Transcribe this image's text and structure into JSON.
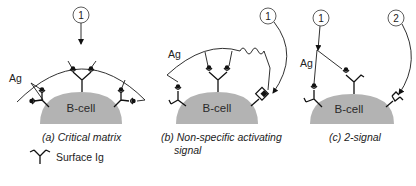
{
  "panels": [
    {
      "id": "a",
      "caption": "(a) Critical matrix",
      "cell_label": "B-cell",
      "antigen_label": "Ag",
      "signals": [
        {
          "number": "1"
        }
      ]
    },
    {
      "id": "b",
      "caption_line1": "(b) Non-specific activating",
      "caption_line2": "signal",
      "cell_label": "B-cell",
      "antigen_label": "Ag",
      "signals": [
        {
          "number": "1"
        }
      ]
    },
    {
      "id": "c",
      "caption": "(c) 2-signal",
      "cell_label": "B-cell",
      "antigen_label": "Ag",
      "signals": [
        {
          "number": "1"
        },
        {
          "number": "2"
        }
      ]
    }
  ],
  "legend": {
    "symbol": "surface-ig-icon",
    "label": "Surface Ig"
  },
  "colors": {
    "cell_fill": "#b3b3b3",
    "line": "#1a1a1a",
    "background": "#ffffff"
  }
}
